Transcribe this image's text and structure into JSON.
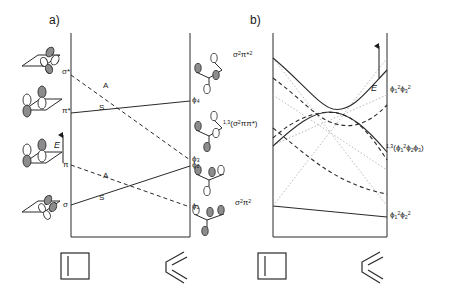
{
  "figure": {
    "kind": "orbital-and-state-correlation-diagram",
    "panels": [
      {
        "tag": "a)",
        "name": "orbital-correlation-diagram"
      },
      {
        "tag": "b)",
        "name": "state-correlation-diagram"
      }
    ]
  },
  "panel_a": {
    "tag": "a)",
    "axis_label": "E",
    "left_orbital_labels": [
      {
        "id": "sigma-star",
        "text": "σ*"
      },
      {
        "id": "pi-star",
        "text": "π*"
      },
      {
        "id": "pi",
        "text": "π"
      },
      {
        "id": "sigma",
        "text": "σ"
      }
    ],
    "right_orbital_labels": [
      {
        "id": "phi4",
        "text": "ϕ₄"
      },
      {
        "id": "phi3",
        "text": "ϕ₃"
      },
      {
        "id": "phi2",
        "text": "ϕ₂"
      },
      {
        "id": "phi1",
        "text": "ϕ₁"
      }
    ],
    "symmetry_labels": [
      {
        "id": "A-upper",
        "text": "A",
        "style": "dashed"
      },
      {
        "id": "S-upper",
        "text": "S",
        "style": "solid"
      },
      {
        "id": "A-lower",
        "text": "A",
        "style": "dashed"
      },
      {
        "id": "S-lower",
        "text": "S",
        "style": "solid"
      }
    ],
    "correlations": [
      {
        "from": "σ*",
        "to": "ϕ₃",
        "symmetry": "A",
        "style": "dashed"
      },
      {
        "from": "π*",
        "to": "ϕ₄",
        "symmetry": "S",
        "style": "solid"
      },
      {
        "from": "π",
        "to": "ϕ₁",
        "symmetry": "A",
        "style": "dashed"
      },
      {
        "from": "σ",
        "to": "ϕ₂",
        "symmetry": "S",
        "style": "solid"
      }
    ]
  },
  "panel_b": {
    "tag": "b)",
    "axis_label": "E",
    "left_state_labels": [
      {
        "id": "sigma2-pistar2",
        "html": "σ<sup>2</sup>π*<sup>2</sup>"
      },
      {
        "id": "sigma2-pi-pistar",
        "html": "<span class=\"presup\">1,3</span>(σ<sup>2</sup>ππ*)"
      },
      {
        "id": "sigma2-pi2",
        "html": "σ<sup>2</sup>π<sup>2</sup>"
      }
    ],
    "right_state_labels": [
      {
        "id": "phi1sq-phi3sq",
        "html": "ϕ<sub>1</sub><sup>2</sup>ϕ<sub>3</sub><sup>2</sup>"
      },
      {
        "id": "phi1sq-phi2-phi3",
        "html": "<span class=\"presup\">1,3</span>(ϕ<sub>1</sub><sup>2</sup>ϕ<sub>2</sub>ϕ<sub>3</sub>)"
      },
      {
        "id": "phi1sq-phi2sq",
        "html": "ϕ<sub>1</sub><sup>2</sup>ϕ<sub>2</sub><sup>2</sup>"
      }
    ],
    "features": [
      "avoided crossing between ground and doubly-excited state",
      "dotted diabatic (crossing) correlation lines",
      "solid lines = singlet closed-shell states",
      "dashed lines = singlet/triplet open-shell states"
    ]
  },
  "structures": {
    "reactant": {
      "id": "cyclobutene",
      "shape": "square-with-double-bond"
    },
    "product": {
      "id": "butadiene",
      "shape": "s-cis-zigzag-with-two-double-bonds"
    }
  },
  "colors": {
    "ink": "#1a1a1a",
    "line": "#2a2a2a",
    "faint": "#9a9a9a",
    "lobe_shaded": "#8c8c8c",
    "lobe_empty": "#ffffff"
  }
}
